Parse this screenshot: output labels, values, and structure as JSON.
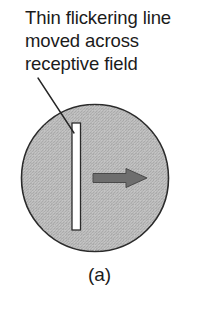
{
  "figure": {
    "background_color": "#ffffff",
    "width": 199,
    "height": 324,
    "caption": {
      "line1": "Thin flickering line",
      "line2": "moved across",
      "line3": "receptive field",
      "color": "#1b1b1b"
    },
    "panel_label": "(a)",
    "receptive_field": {
      "shape": "circle",
      "center_x": 95,
      "center_y": 178,
      "radius": 73.5,
      "fill_color": "#b9b9b9",
      "stroke_color": "#2b2b2b",
      "texture": "dithered-gray-stipple"
    },
    "stimulus_bar": {
      "shape": "thin-vertical-rectangle",
      "x": 72,
      "y": 123,
      "width": 8.5,
      "height": 107,
      "fill_color": "#ffffff",
      "stroke_color": "#2b2b2b"
    },
    "motion_arrow": {
      "direction": "right",
      "shaft_start_x": 93,
      "shaft_end_x": 126,
      "tip_x": 147,
      "center_y": 178,
      "shaft_thickness": 9,
      "head_height": 19,
      "fill_color": "#6e6e6e",
      "stroke_color": "#4a4a4a"
    },
    "leader_line": {
      "from_x": 38,
      "from_y": 78,
      "to_x": 74,
      "to_y": 133,
      "color": "#262626",
      "width": 1.4
    }
  }
}
